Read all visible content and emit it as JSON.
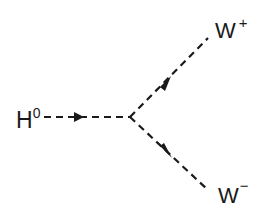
{
  "diagram": {
    "type": "feynman",
    "particles": {
      "incoming": {
        "label": "H",
        "superscript": "0"
      },
      "outgoing_top": {
        "label": "W",
        "superscript": "+"
      },
      "outgoing_bottom": {
        "label": "W",
        "superscript": "−"
      }
    },
    "line_color": "#1a1a1a"
  }
}
